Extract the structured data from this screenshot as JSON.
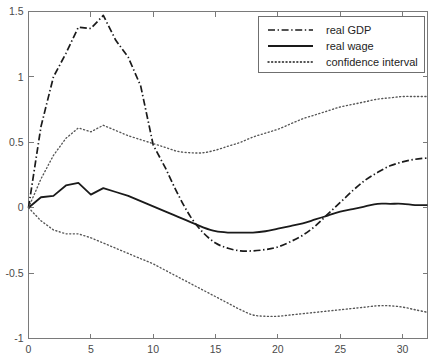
{
  "chart_data": {
    "type": "line",
    "title": "",
    "subtitle": "",
    "xlabel": "",
    "ylabel": "",
    "xlim": [
      0,
      32
    ],
    "ylim": [
      -1,
      1.5
    ],
    "xticks": [
      0,
      5,
      10,
      15,
      20,
      25,
      30
    ],
    "yticks": [
      -1,
      -0.5,
      0,
      0.5,
      1,
      1.5
    ],
    "xticklabels": [
      "0",
      "5",
      "10",
      "15",
      "20",
      "25",
      "30"
    ],
    "yticklabels": [
      "-1",
      "-0.5",
      "0",
      "0.5",
      "1",
      "1.5"
    ],
    "grid": false,
    "legend_position": "top-right",
    "x": [
      0,
      1,
      2,
      3,
      4,
      5,
      6,
      7,
      8,
      9,
      10,
      11,
      12,
      13,
      14,
      15,
      16,
      17,
      18,
      19,
      20,
      21,
      22,
      23,
      24,
      25,
      26,
      27,
      28,
      29,
      30,
      31,
      32
    ],
    "series": [
      {
        "name": "real GDP",
        "style": "dash-dot",
        "color": "#1a1a1a",
        "values": [
          0.0,
          0.62,
          1.0,
          1.18,
          1.38,
          1.37,
          1.47,
          1.28,
          1.15,
          0.93,
          0.48,
          0.3,
          0.1,
          -0.07,
          -0.19,
          -0.27,
          -0.31,
          -0.33,
          -0.33,
          -0.32,
          -0.3,
          -0.26,
          -0.21,
          -0.14,
          -0.05,
          0.04,
          0.13,
          0.21,
          0.27,
          0.32,
          0.35,
          0.37,
          0.38
        ]
      },
      {
        "name": "real wage",
        "style": "solid",
        "color": "#1a1a1a",
        "values": [
          0.0,
          0.08,
          0.09,
          0.17,
          0.19,
          0.1,
          0.15,
          0.12,
          0.09,
          0.05,
          0.01,
          -0.03,
          -0.07,
          -0.11,
          -0.15,
          -0.18,
          -0.19,
          -0.19,
          -0.19,
          -0.18,
          -0.16,
          -0.14,
          -0.12,
          -0.09,
          -0.06,
          -0.03,
          -0.01,
          0.01,
          0.03,
          0.03,
          0.03,
          0.02,
          0.02
        ]
      },
      {
        "name": "confidence interval",
        "style": "dotted",
        "color": "#555555",
        "band": "upper",
        "values": [
          0.0,
          0.22,
          0.4,
          0.53,
          0.61,
          0.58,
          0.63,
          0.59,
          0.55,
          0.52,
          0.49,
          0.46,
          0.43,
          0.42,
          0.42,
          0.44,
          0.47,
          0.5,
          0.54,
          0.57,
          0.6,
          0.64,
          0.68,
          0.71,
          0.74,
          0.77,
          0.79,
          0.81,
          0.83,
          0.84,
          0.85,
          0.85,
          0.85
        ]
      },
      {
        "name": "confidence interval",
        "style": "dotted",
        "color": "#555555",
        "band": "lower",
        "values": [
          0.0,
          -0.1,
          -0.17,
          -0.2,
          -0.2,
          -0.23,
          -0.27,
          -0.31,
          -0.35,
          -0.39,
          -0.43,
          -0.48,
          -0.53,
          -0.58,
          -0.63,
          -0.68,
          -0.73,
          -0.78,
          -0.82,
          -0.83,
          -0.83,
          -0.82,
          -0.81,
          -0.8,
          -0.79,
          -0.78,
          -0.77,
          -0.76,
          -0.75,
          -0.75,
          -0.76,
          -0.78,
          -0.8
        ]
      }
    ],
    "legend": [
      {
        "label": "real GDP",
        "style": "dash-dot"
      },
      {
        "label": "real wage",
        "style": "solid"
      },
      {
        "label": "confidence interval",
        "style": "dotted"
      }
    ]
  }
}
